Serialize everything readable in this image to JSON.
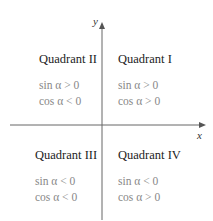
{
  "axes": {
    "x_label": "x",
    "y_label": "y"
  },
  "quadrants": [
    {
      "title": "Quadrant I",
      "sin": "sin α > 0",
      "cos": "cos α > 0"
    },
    {
      "title": "Quadrant II",
      "sin": "sin α > 0",
      "cos": "cos α < 0"
    },
    {
      "title": "Quadrant III",
      "sin": "sin α < 0",
      "cos": "cos α < 0"
    },
    {
      "title": "Quadrant IV",
      "sin": "sin α < 0",
      "cos": "cos α > 0"
    }
  ],
  "colors": {
    "axis": "#555555",
    "title": "#222222",
    "condition": "#888888"
  }
}
